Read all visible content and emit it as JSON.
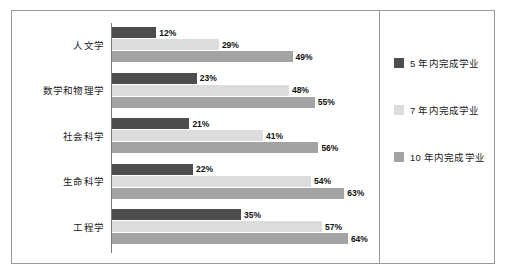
{
  "chart_data": {
    "type": "bar",
    "orientation": "horizontal",
    "title": "",
    "xlabel": "",
    "ylabel": "",
    "grid": false,
    "legend_position": "right",
    "xlim": [
      0,
      70
    ],
    "value_suffix": "%",
    "categories": [
      "人文学",
      "数学和物理学",
      "社会科学",
      "生命科学",
      "工程学"
    ],
    "series": [
      {
        "name": "5 年内完成学业",
        "color": "#4d4d4d",
        "values": [
          12,
          23,
          21,
          22,
          35
        ],
        "labels": [
          "12%",
          "23%",
          "21%",
          "22%",
          "35%"
        ]
      },
      {
        "name": "7 年内完成学业",
        "color": "#dcdcdc",
        "values": [
          29,
          48,
          41,
          54,
          57
        ],
        "labels": [
          "29%",
          "48%",
          "41%",
          "54%",
          "57%"
        ]
      },
      {
        "name": "10 年内完成学业",
        "color": "#a3a3a3",
        "values": [
          49,
          55,
          56,
          63,
          64
        ],
        "labels": [
          "49%",
          "55%",
          "56%",
          "63%",
          "64%"
        ]
      }
    ]
  }
}
